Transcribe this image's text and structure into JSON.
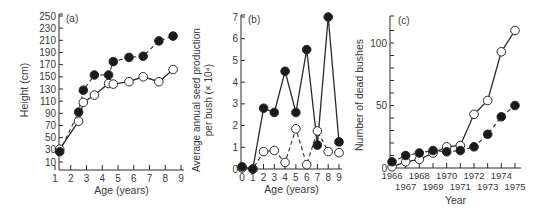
{
  "figure": {
    "colors": {
      "ink": "#2a2a2a",
      "text": "#3a3a3a",
      "open_fill": "#ffffff",
      "filled": "#1a1a1a"
    }
  },
  "chart_data": [
    {
      "panel": "(a)",
      "type": "line",
      "title": "",
      "xlabel": "Age (years)",
      "ylabel": "Height (cm)",
      "xlim": [
        1,
        9
      ],
      "ylim": [
        10,
        250
      ],
      "xticks": [
        1,
        2,
        3,
        4,
        5,
        6,
        7,
        8,
        9
      ],
      "yticks": [
        10,
        30,
        50,
        70,
        90,
        110,
        130,
        150,
        170,
        190,
        210,
        230,
        250
      ],
      "grid": false,
      "legend": null,
      "series": [
        {
          "name": "filled",
          "marker": "filled-circle",
          "line": "dashed",
          "x": [
            1.3,
            2.5,
            2.8,
            3.5,
            4.4,
            4.7,
            5.7,
            6.6,
            7.6,
            8.5
          ],
          "values": [
            27,
            92,
            128,
            153,
            153,
            175,
            182,
            184,
            209,
            217
          ]
        },
        {
          "name": "open",
          "marker": "open-circle",
          "line": "solid",
          "x": [
            1.3,
            2.5,
            2.8,
            3.5,
            4.4,
            4.7,
            5.7,
            6.6,
            7.6,
            8.5
          ],
          "values": [
            31,
            77,
            108,
            120,
            139,
            138,
            142,
            150,
            142,
            162
          ]
        }
      ]
    },
    {
      "panel": "(b)",
      "type": "line",
      "title": "",
      "xlabel": "Age (years)",
      "ylabel": "Average annual seed production per bush (× 10⁴)",
      "ylabel_line1": "Average annual seed production",
      "ylabel_line2": "per bush (× 10⁴)",
      "xlim": [
        0,
        9
      ],
      "ylim": [
        0,
        7
      ],
      "xticks": [
        0,
        1,
        2,
        3,
        4,
        5,
        6,
        7,
        8,
        9
      ],
      "yticks": [
        0,
        1,
        2,
        3,
        4,
        5,
        6,
        7
      ],
      "grid": false,
      "legend": null,
      "series": [
        {
          "name": "filled",
          "marker": "filled-circle",
          "line": "solid",
          "x": [
            0,
            1,
            2,
            3,
            4,
            5,
            6,
            7,
            8,
            9
          ],
          "values": [
            0.1,
            0.0,
            2.8,
            2.6,
            4.5,
            2.6,
            5.5,
            1.1,
            7.0,
            1.25
          ]
        },
        {
          "name": "open",
          "marker": "open-circle",
          "line": "dashed",
          "x": [
            0,
            1,
            2,
            3,
            4,
            5,
            6,
            7,
            8,
            9
          ],
          "values": [
            0.05,
            0.0,
            0.8,
            0.85,
            0.3,
            1.85,
            0.2,
            1.75,
            0.8,
            0.75
          ]
        }
      ]
    },
    {
      "panel": "(c)",
      "type": "line",
      "title": "",
      "xlabel": "Year",
      "ylabel": "Number of dead bushes",
      "xlim": [
        1966,
        1975
      ],
      "ylim": [
        0,
        115
      ],
      "xticks": [
        1966,
        1967,
        1968,
        1969,
        1970,
        1971,
        1972,
        1973,
        1974,
        1975
      ],
      "xtick_labels_top": [
        "1966",
        "1968",
        "1970",
        "1972",
        "1974"
      ],
      "xtick_labels_bottom": [
        "1967",
        "1969",
        "1971",
        "1973",
        "1975"
      ],
      "yticks": [
        0,
        50,
        100
      ],
      "minor_yticks": [
        10,
        20,
        30,
        40,
        60,
        70,
        80,
        90,
        110
      ],
      "grid": false,
      "legend": null,
      "series": [
        {
          "name": "open",
          "marker": "open-circle",
          "line": "solid",
          "x": [
            1966,
            1967,
            1968,
            1969,
            1970,
            1971,
            1972,
            1973,
            1974,
            1975
          ],
          "values": [
            1,
            5,
            7,
            12,
            17,
            18,
            43,
            54,
            93,
            110
          ]
        },
        {
          "name": "filled",
          "marker": "filled-circle",
          "line": "dashed",
          "x": [
            1966,
            1967,
            1968,
            1969,
            1970,
            1971,
            1972,
            1973,
            1974,
            1975
          ],
          "values": [
            5,
            10,
            12,
            14,
            13,
            14,
            17,
            27,
            41,
            50
          ]
        }
      ]
    }
  ],
  "layout": [
    {
      "ox": 59,
      "x0px": 55,
      "x1px": 181,
      "axis_y": 170,
      "y0px": 162,
      "y1px": 16,
      "top": 14,
      "panel_label_x": 66,
      "panel_label_y": 22,
      "ylabel_x": 28,
      "ylabel_y": 90,
      "xlabel_y": 194
    },
    {
      "ox": 241,
      "x0px": 242,
      "x1px": 339,
      "axis_y": 169,
      "y0px": 169,
      "y1px": 17,
      "top": 15,
      "panel_label_x": 248,
      "panel_label_y": 23,
      "ylabel_x": 200,
      "ylabel_y": 100,
      "xlabel_y": 193
    },
    {
      "ox": 390,
      "x0px": 392,
      "x1px": 515,
      "axis_y": 168,
      "y0px": 168,
      "y1px": 43,
      "top": 16,
      "panel_label_x": 398,
      "panel_label_y": 24,
      "ylabel_x": 363,
      "ylabel_y": 95,
      "xlabel_y": 204
    }
  ]
}
